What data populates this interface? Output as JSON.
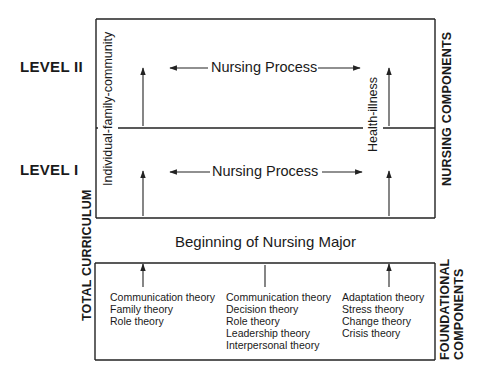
{
  "diagram": {
    "levels": [
      {
        "label": "LEVEL II",
        "process_label": "Nursing Process"
      },
      {
        "label": "LEVEL I",
        "process_label": "Nursing Process"
      }
    ],
    "vertical_axis_labels": {
      "left": "Individual-family-community",
      "right": "Health-illness"
    },
    "side_labels": {
      "total_curriculum": "TOTAL CURRICULUM",
      "nursing_components": "NURSING COMPONENTS",
      "foundational_line1": "FOUNDATIONAL",
      "foundational_line2": "COMPONENTS"
    },
    "divider_label": "Beginning of Nursing Major",
    "foundational_columns": [
      {
        "items": [
          "Communication theory",
          "Family theory",
          "Role theory"
        ]
      },
      {
        "items": [
          "Communication theory",
          "Decision theory",
          "Role theory",
          "Leadership theory",
          "Interpersonal theory"
        ]
      },
      {
        "items": [
          "Adaptation theory",
          "Stress theory",
          "Change theory",
          "Crisis theory"
        ]
      }
    ],
    "colors": {
      "line": "#222222",
      "text": "#1a1a1a",
      "background": "#ffffff"
    }
  }
}
